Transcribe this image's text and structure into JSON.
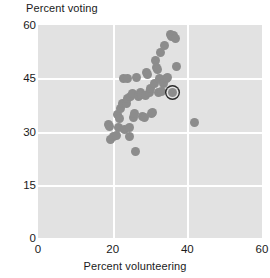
{
  "chart_data": {
    "type": "scatter",
    "title": "",
    "xlabel": "Percent volunteering",
    "ylabel": "Percent voting",
    "xlim": [
      0,
      60
    ],
    "ylim": [
      0,
      60
    ],
    "xticks": [
      0,
      20,
      40,
      60
    ],
    "yticks": [
      0,
      15,
      30,
      45,
      60
    ],
    "grid": true,
    "grid_color": "#ffffff",
    "plot_background": "#e2e2e2",
    "point_color": "#8c8c8c",
    "highlight_outline_color": "#2a2a2a",
    "legend": null,
    "series": [
      {
        "name": "states",
        "marker": "circle",
        "points": [
          {
            "x": 18.8,
            "y": 32.0
          },
          {
            "x": 19.1,
            "y": 31.3
          },
          {
            "x": 19.4,
            "y": 27.7
          },
          {
            "x": 20.1,
            "y": 28.6
          },
          {
            "x": 20.9,
            "y": 28.8
          },
          {
            "x": 21.2,
            "y": 34.8
          },
          {
            "x": 21.6,
            "y": 31.1
          },
          {
            "x": 21.9,
            "y": 33.6
          },
          {
            "x": 22.2,
            "y": 36.5
          },
          {
            "x": 22.5,
            "y": 37.8
          },
          {
            "x": 23.0,
            "y": 44.9
          },
          {
            "x": 23.3,
            "y": 30.6
          },
          {
            "x": 23.6,
            "y": 38.0
          },
          {
            "x": 23.9,
            "y": 39.4
          },
          {
            "x": 24.1,
            "y": 44.8
          },
          {
            "x": 24.4,
            "y": 31.0
          },
          {
            "x": 24.6,
            "y": 28.7
          },
          {
            "x": 24.9,
            "y": 40.0
          },
          {
            "x": 25.2,
            "y": 40.6
          },
          {
            "x": 25.6,
            "y": 33.9
          },
          {
            "x": 25.9,
            "y": 35.2
          },
          {
            "x": 26.2,
            "y": 24.3
          },
          {
            "x": 26.4,
            "y": 45.2
          },
          {
            "x": 26.8,
            "y": 39.8
          },
          {
            "x": 27.0,
            "y": 40.2
          },
          {
            "x": 27.4,
            "y": 41.0
          },
          {
            "x": 27.8,
            "y": 40.4
          },
          {
            "x": 28.1,
            "y": 34.3
          },
          {
            "x": 28.5,
            "y": 34.0
          },
          {
            "x": 28.8,
            "y": 40.1
          },
          {
            "x": 29.1,
            "y": 46.6
          },
          {
            "x": 29.4,
            "y": 46.1
          },
          {
            "x": 29.8,
            "y": 41.0
          },
          {
            "x": 30.1,
            "y": 42.2
          },
          {
            "x": 30.4,
            "y": 35.0
          },
          {
            "x": 30.8,
            "y": 35.4
          },
          {
            "x": 31.1,
            "y": 43.6
          },
          {
            "x": 31.5,
            "y": 50.0
          },
          {
            "x": 31.8,
            "y": 48.0
          },
          {
            "x": 32.0,
            "y": 47.6
          },
          {
            "x": 32.3,
            "y": 41.0
          },
          {
            "x": 32.6,
            "y": 44.9
          },
          {
            "x": 32.9,
            "y": 52.2
          },
          {
            "x": 33.2,
            "y": 41.3
          },
          {
            "x": 33.6,
            "y": 43.6
          },
          {
            "x": 34.0,
            "y": 54.3
          },
          {
            "x": 34.4,
            "y": 44.8
          },
          {
            "x": 34.8,
            "y": 45.1
          },
          {
            "x": 35.4,
            "y": 57.2
          },
          {
            "x": 35.8,
            "y": 56.9
          },
          {
            "x": 36.4,
            "y": 57.0
          },
          {
            "x": 36.8,
            "y": 56.3
          },
          {
            "x": 37.1,
            "y": 48.2
          },
          {
            "x": 41.8,
            "y": 32.5
          }
        ]
      }
    ],
    "highlighted_point": {
      "x": 35.9,
      "y": 41.0,
      "label": ""
    }
  }
}
